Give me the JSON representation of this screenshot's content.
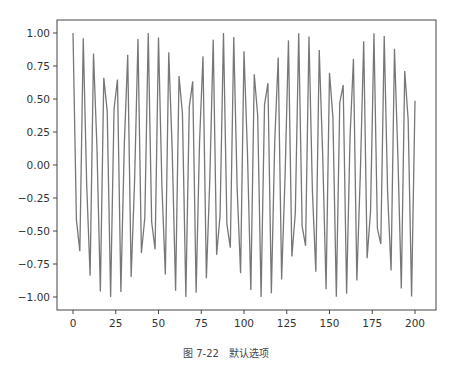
{
  "chart_data": {
    "type": "line",
    "title": "",
    "xlabel": "",
    "ylabel": "",
    "function": "y = cos(x), x from 0 to 200 step 2",
    "x_start": 0,
    "x_end": 200,
    "x_step": 2,
    "xlim": [
      -10,
      210
    ],
    "ylim": [
      -1.1,
      1.1
    ],
    "xticks": [
      0,
      25,
      50,
      75,
      100,
      125,
      150,
      175,
      200
    ],
    "xtick_labels": [
      "0",
      "25",
      "50",
      "75",
      "100",
      "125",
      "150",
      "175",
      "200"
    ],
    "yticks": [
      1.0,
      0.75,
      0.5,
      0.25,
      0.0,
      -0.25,
      -0.5,
      -0.75,
      -1.0
    ],
    "ytick_labels": [
      "1.00",
      "0.75",
      "0.50",
      "0.25",
      "0.00",
      "−0.25",
      "−0.50",
      "−0.75",
      "−1.00"
    ],
    "grid": false,
    "legend": null,
    "line_color": "#777777",
    "series": [
      {
        "name": "cos(x)"
      }
    ]
  },
  "caption": "图 7-22　默认选项"
}
